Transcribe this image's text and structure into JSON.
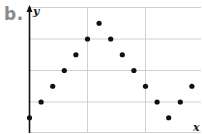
{
  "panel_label": "b.",
  "chart_data": {
    "type": "scatter",
    "title": "",
    "xlabel": "x",
    "ylabel": "y",
    "grid": true,
    "legend": null,
    "x": [
      0,
      1,
      2,
      3,
      4,
      5,
      6,
      7,
      8,
      9,
      10,
      11,
      12,
      13,
      14
    ],
    "y": [
      1,
      2,
      3,
      4,
      5,
      6,
      7,
      6,
      5,
      4,
      3,
      2,
      1,
      2,
      3
    ],
    "xlim": [
      0,
      14.5
    ],
    "ylim": [
      0,
      8
    ],
    "grid_x_every": 5,
    "grid_y_every": 2,
    "point_color": "#111111",
    "grid_color": "#d0d0d0",
    "axis_color": "#111111"
  }
}
